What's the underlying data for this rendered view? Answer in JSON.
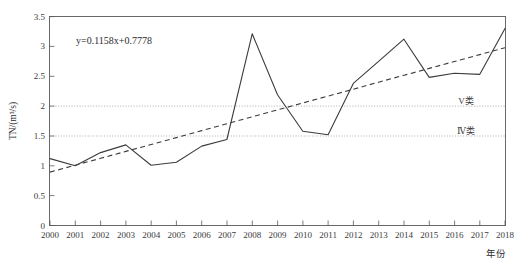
{
  "chart_data": {
    "type": "line",
    "title": "",
    "xlabel": "年份",
    "ylabel": "TN/(m³/s)",
    "xlim": [
      2000,
      2018
    ],
    "ylim": [
      0,
      3.5
    ],
    "grid": true,
    "legend_position": "none",
    "x": [
      2000,
      2001,
      2002,
      2003,
      2004,
      2005,
      2006,
      2007,
      2008,
      2009,
      2010,
      2011,
      2012,
      2013,
      2014,
      2015,
      2016,
      2017,
      2018
    ],
    "xtick_labels": [
      "2000",
      "2001",
      "2002",
      "2003",
      "2004",
      "2005",
      "2006",
      "2007",
      "2008",
      "2009",
      "2010",
      "2011",
      "2012",
      "2013",
      "2014",
      "2015",
      "2016",
      "2017",
      "2018"
    ],
    "ytick_labels": [
      "0",
      "0.5",
      "1",
      "1.5",
      "2",
      "2.5",
      "3",
      "3.5"
    ],
    "ytick_values": [
      0,
      0.5,
      1,
      1.5,
      2,
      2.5,
      3,
      3.5
    ],
    "series": [
      {
        "name": "TN",
        "style": "solid",
        "values": [
          1.12,
          1.0,
          1.22,
          1.35,
          1.01,
          1.06,
          1.33,
          1.44,
          3.21,
          2.19,
          1.58,
          1.52,
          2.38,
          2.75,
          3.12,
          2.48,
          2.55,
          2.53,
          3.3
        ]
      },
      {
        "name": "线性趋势线",
        "style": "dashed",
        "equation": "y=0.1158x+0.7778",
        "slope": 0.1158,
        "intercept": 0.7778,
        "values": [
          0.8936,
          1.0094,
          1.1252,
          1.241,
          1.3568,
          1.4726,
          1.5884,
          1.7042,
          1.82,
          1.9358,
          2.0516,
          2.1674,
          2.2832,
          2.399,
          2.5148,
          2.6306,
          2.7464,
          2.8622,
          2.978
        ]
      }
    ],
    "annotations": [
      {
        "name": "regression-equation",
        "text": "y=0.1158x+0.7778",
        "x": 2001.2,
        "y": 3.12
      }
    ],
    "threshold_lines": [
      {
        "name": "class-v",
        "label": "V类",
        "value": 2.0
      },
      {
        "name": "class-iv",
        "label": "Ⅳ类",
        "value": 1.5
      }
    ]
  }
}
